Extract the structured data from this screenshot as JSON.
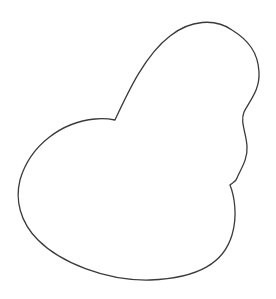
{
  "canvas": {
    "width": 276,
    "height": 299,
    "background": "#ffffff"
  },
  "shape": {
    "description": "single closed irregular outline resembling a lopsided heart / blob",
    "stroke_color": "#3a3a3a",
    "fill_color": "#ffffff",
    "stroke_width": 1.3,
    "path": "M 115 120 C 128 92 145 55 170 36 C 190 20 215 18 232 30 C 248 40 258 52 259 72 C 260 90 250 100 244 112 C 240 122 246 132 247 146 C 248 160 240 170 237 178 C 236 182 232 183 230 185 C 234 195 238 215 232 235 C 224 262 200 278 150 280 C 105 281 60 262 38 240 C 20 222 15 200 20 180 C 30 145 62 122 95 119 C 104 118 110 119 115 120 Z"
  }
}
